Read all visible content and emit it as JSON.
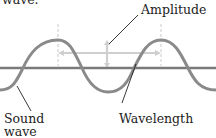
{
  "diagram": {
    "title_fragment": "wave.",
    "labels": {
      "amplitude": "Amplitude",
      "sound_wave_line1": "Sound",
      "sound_wave_line2": "wave",
      "wavelength": "Wavelength"
    },
    "colors": {
      "wave": "#8a8a8a",
      "axis": "#7a7a7a",
      "measure_arrows": "#cfcfcf",
      "dashed_guides": "#bdbdbd",
      "leader_lines": "#222222",
      "text": "#222222"
    }
  }
}
